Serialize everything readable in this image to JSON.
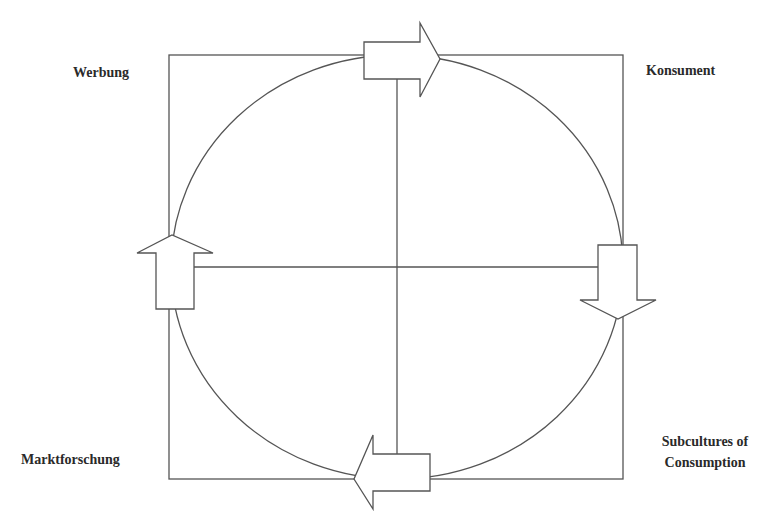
{
  "diagram": {
    "type": "cycle",
    "colors": {
      "stroke": "#555555",
      "text": "#2a2a2a",
      "background": "#ffffff",
      "arrow_fill": "#ffffff"
    },
    "labels": {
      "top_left": "Werbung",
      "top_right": "Konsument",
      "bottom_left": "Marktforschung",
      "bottom_right_line1": "Subcultures of",
      "bottom_right_line2": "Consumption"
    },
    "flow": [
      {
        "from": "Werbung",
        "to": "Konsument",
        "arrow": "right",
        "position": "top"
      },
      {
        "from": "Konsument",
        "to": "Subcultures of Consumption",
        "arrow": "down",
        "position": "right"
      },
      {
        "from": "Subcultures of Consumption",
        "to": "Marktforschung",
        "arrow": "left",
        "position": "bottom"
      },
      {
        "from": "Marktforschung",
        "to": "Werbung",
        "arrow": "up",
        "position": "left"
      }
    ]
  }
}
